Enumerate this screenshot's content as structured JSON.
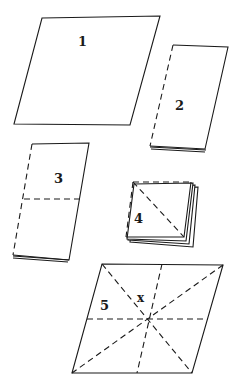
{
  "diagram": {
    "colors": {
      "line": "#1a1a1a",
      "background": "#ffffff"
    },
    "steps": [
      {
        "id": 1,
        "label": "1",
        "description": "Flat square sheet"
      },
      {
        "id": 2,
        "label": "2",
        "description": "Sheet folded in half along dashed edge"
      },
      {
        "id": 3,
        "label": "3",
        "description": "Folded again; horizontal dashed fold line"
      },
      {
        "id": 4,
        "label": "4",
        "description": "Folded to small square with diagonal dashed fold"
      },
      {
        "id": 5,
        "label": "5",
        "description": "Unfolded sheet showing fold lines through center",
        "marker": "x"
      }
    ]
  }
}
